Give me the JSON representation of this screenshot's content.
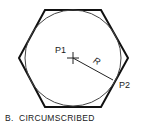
{
  "diagram": {
    "caption": "B.  CIRCUMSCRIBED",
    "labels": {
      "center": "P1",
      "vertex": "P2",
      "radius": "R"
    },
    "shapes": {
      "hexagon": {
        "points": [
          [
            45,
            10
          ],
          [
            101,
            10
          ],
          [
            128,
            58
          ],
          [
            101,
            107
          ],
          [
            45,
            107
          ],
          [
            19,
            58
          ]
        ],
        "stroke": "#111111"
      },
      "circle": {
        "cx": 73,
        "cy": 58,
        "r": 48,
        "stroke": "#444444"
      },
      "radius_line": {
        "from": [
          73,
          58
        ],
        "to": [
          113,
          80
        ]
      }
    }
  }
}
